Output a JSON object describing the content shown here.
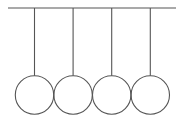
{
  "diagram": {
    "ball_count": 4,
    "colors": {
      "line": "#555555",
      "background": "#ffffff"
    }
  }
}
